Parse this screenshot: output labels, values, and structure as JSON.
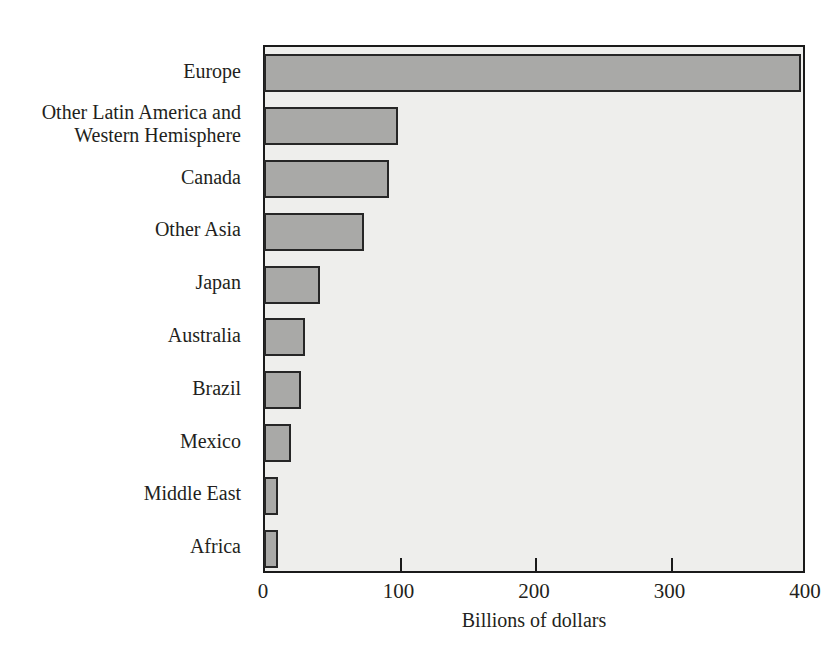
{
  "figure": {
    "caption_remnant": "",
    "plot_background_color": "#eeeeec",
    "bar_fill_color": "#a9a9a7",
    "bar_border_color": "#262626",
    "axis_color": "#1a1a1a"
  },
  "chart_data": {
    "type": "bar",
    "orientation": "horizontal",
    "title": "",
    "xlabel": "Billions of dollars",
    "ylabel": "",
    "xlim": [
      0,
      400
    ],
    "xticks": [
      0,
      100,
      200,
      300,
      400
    ],
    "xtick_labels": [
      "0",
      "100",
      "200",
      "300",
      "400"
    ],
    "grid": false,
    "legend": null,
    "categories": [
      "Europe",
      "Other Latin America and\nWestern Hemisphere",
      "Canada",
      "Other Asia",
      "Japan",
      "Australia",
      "Brazil",
      "Mexico",
      "Middle East",
      "Africa"
    ],
    "values": [
      396,
      99,
      92,
      74,
      41,
      30,
      27,
      20,
      10,
      10
    ]
  }
}
